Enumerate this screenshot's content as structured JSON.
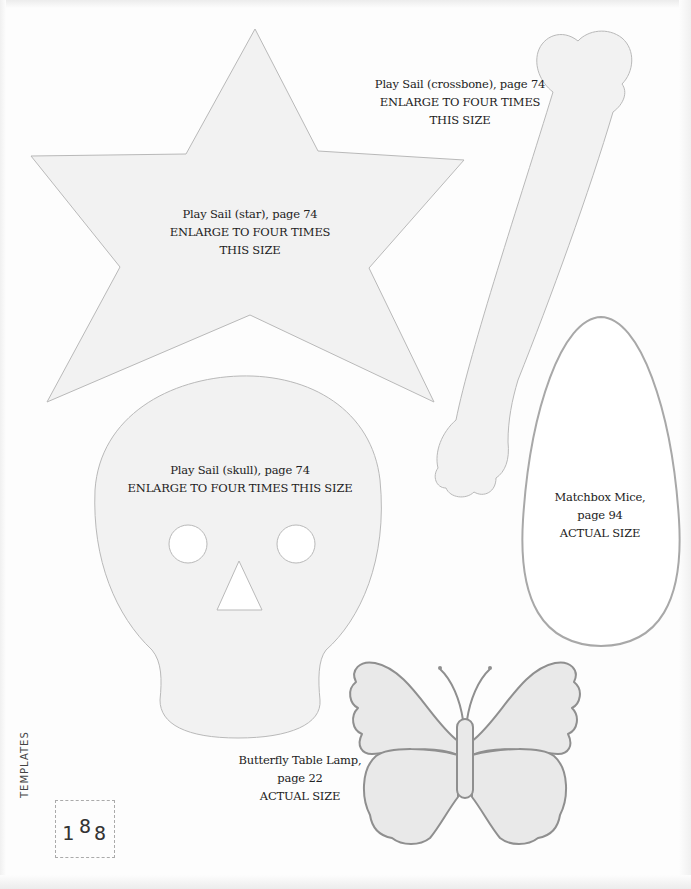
{
  "page": {
    "section_label": "TEMPLATES",
    "page_number_digits": [
      "1",
      "8",
      "8"
    ],
    "page_number": "188"
  },
  "templates": {
    "crossbone": {
      "lines": [
        "Play Sail (crossbone), page 74",
        "ENLARGE TO FOUR TIMES",
        "THIS SIZE"
      ]
    },
    "star": {
      "lines": [
        "Play Sail (star), page 74",
        "ENLARGE TO FOUR TIMES",
        "THIS SIZE"
      ]
    },
    "skull": {
      "lines": [
        "Play Sail (skull), page 74",
        "ENLARGE TO FOUR TIMES THIS SIZE"
      ]
    },
    "mice": {
      "lines": [
        "Matchbox Mice,",
        "page 94",
        "ACTUAL SIZE"
      ]
    },
    "butterfly": {
      "lines": [
        "Butterfly Table Lamp,",
        "page 22",
        "ACTUAL SIZE"
      ]
    }
  },
  "colors": {
    "shape_fill": "#f2f2f2",
    "shape_stroke": "#b9b9b9",
    "butterfly_fill": "#e9e9e9",
    "butterfly_stroke": "#8f8f8f",
    "mice_stroke": "#a8a8a8",
    "text": "#222222"
  }
}
